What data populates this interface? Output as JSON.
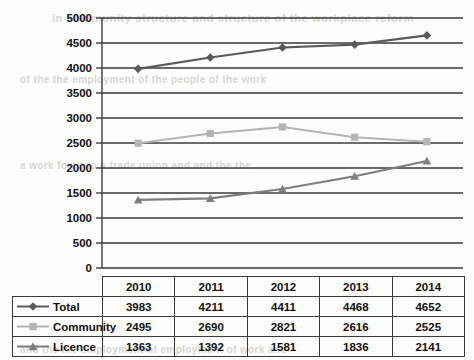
{
  "chart_data": {
    "type": "line",
    "title": "",
    "subtitle": "",
    "xlabel": "",
    "ylabel": "",
    "categories": [
      "2010",
      "2011",
      "2012",
      "2013",
      "2014"
    ],
    "ylim": [
      0,
      5000
    ],
    "ytick_step": 500,
    "yticks": [
      "0",
      "500",
      "1000",
      "1500",
      "2000",
      "2500",
      "3000",
      "3500",
      "4000",
      "4500",
      "5000"
    ],
    "grid": "horizontal",
    "legend_position": "data-table-below",
    "series": [
      {
        "name": "Total",
        "marker": "diamond",
        "color": "#5a5a5a",
        "values": [
          3983,
          4211,
          4411,
          4468,
          4652
        ],
        "value_labels": [
          "3983",
          "4211",
          "4411",
          "4468",
          "4652"
        ]
      },
      {
        "name": "Community",
        "marker": "square",
        "color": "#b4b4b4",
        "values": [
          2495,
          2690,
          2821,
          2616,
          2525
        ],
        "value_labels": [
          "2495",
          "2690",
          "2821",
          "2616",
          "2525"
        ]
      },
      {
        "name": "Licence",
        "marker": "triangle",
        "color": "#7d7d7d",
        "values": [
          1363,
          1392,
          1581,
          1836,
          2141
        ],
        "value_labels": [
          "1363",
          "1392",
          "1581",
          "1836",
          "2141"
        ]
      }
    ]
  },
  "table": {
    "header_row": [
      "",
      "2010",
      "2011",
      "2012",
      "2013",
      "2014"
    ],
    "rows": [
      {
        "label": "Total",
        "marker": "diamond-marker-icon",
        "cells": [
          "3983",
          "4211",
          "4411",
          "4468",
          "4652"
        ]
      },
      {
        "label": "Community",
        "marker": "square-marker-icon",
        "cells": [
          "2495",
          "2690",
          "2821",
          "2616",
          "2525"
        ]
      },
      {
        "label": "Licence",
        "marker": "triangle-marker-icon",
        "cells": [
          "1363",
          "1392",
          "1581",
          "1836",
          "2141"
        ]
      }
    ]
  },
  "colors": {
    "total": "#5a5a5a",
    "community": "#b4b4b4",
    "licence": "#7d7d7d",
    "gridline": "#3a3a3a",
    "axis": "#3a3a3a",
    "text": "#111111"
  },
  "background_bleed": [
    "in community structure and structure of the workplace reform",
    "of the the employment of the people of the work",
    "a work force to a trade union and and the the",
    "and the the employment of employment of work and"
  ]
}
